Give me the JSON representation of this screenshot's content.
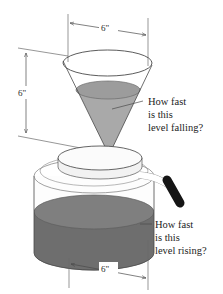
{
  "figure": {
    "background_color": "#ffffff"
  },
  "dimensions": {
    "cone_diameter": {
      "label": "6\"",
      "name": "cone-top-diameter"
    },
    "cone_height": {
      "label": "6\"",
      "name": "cone-height"
    },
    "cylinder_diameter": {
      "label": "6\"",
      "name": "cylinder-diameter"
    }
  },
  "callouts": {
    "upper": {
      "line1": "How fast",
      "line2": "is this",
      "line3": "level falling?"
    },
    "lower": {
      "line1": "How fast",
      "line2": "is this",
      "line3": "level rising?"
    }
  },
  "colors": {
    "cone_liquid": "#a9a9a9",
    "cone_liquid_surface": "#9c9c9c",
    "cylinder_liquid_top": "#7f7f7f",
    "cylinder_liquid_body": "#6e6e6e",
    "outline": "#4a4a4a",
    "handle": "#151515",
    "lid": "#f7f7f7",
    "glass": "#fdfdfd"
  },
  "parts": {
    "cone": "cone-funnel",
    "cylinder": "cylinder-pot",
    "lid": "pot-lid",
    "handle": "pot-handle",
    "spout": "pot-spout-arm"
  }
}
